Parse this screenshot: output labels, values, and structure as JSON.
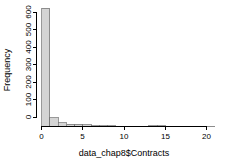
{
  "chart_data": {
    "type": "bar",
    "subtype": "histogram",
    "title": "",
    "xlabel": "data_chap8$Contracts",
    "ylabel": "Frequency",
    "xlim": [
      0,
      21
    ],
    "ylim": [
      0,
      640
    ],
    "grid": false,
    "legend": null,
    "bin_width": 1,
    "xticks": [
      0,
      5,
      10,
      15,
      20
    ],
    "xtick_labels": [
      "0",
      "5",
      "10",
      "15",
      "20"
    ],
    "yticks": [
      0,
      100,
      200,
      300,
      400,
      500,
      600
    ],
    "ytick_labels": [
      "0",
      "100",
      "200",
      "300",
      "400",
      "500",
      "600"
    ],
    "bin_edges": [
      0,
      1,
      2,
      3,
      4,
      5,
      6,
      7,
      8,
      9,
      10,
      11,
      12,
      13,
      14,
      15,
      16,
      17,
      18,
      19,
      20,
      21
    ],
    "categories": [
      "0-1",
      "1-2",
      "2-3",
      "3-4",
      "4-5",
      "5-6",
      "6-7",
      "7-8",
      "8-9",
      "9-10",
      "10-11",
      "11-12",
      "12-13",
      "13-14",
      "14-15",
      "15-16",
      "16-17",
      "17-18",
      "18-19",
      "19-20",
      "20-21"
    ],
    "values": [
      620,
      45,
      20,
      13,
      12,
      10,
      4,
      3,
      3,
      2,
      2,
      2,
      2,
      3,
      3,
      1,
      1,
      1,
      1,
      1,
      1
    ],
    "bar_fill_color": "#d4d4d4",
    "bar_border_color": "#6e6e6e",
    "axis_color": "#000000"
  }
}
